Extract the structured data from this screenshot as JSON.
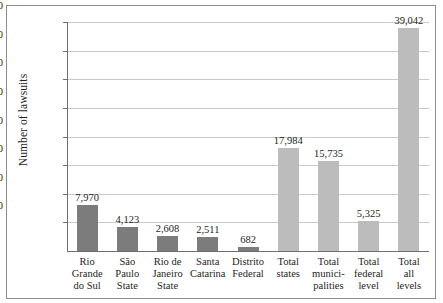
{
  "chart_data": {
    "type": "bar",
    "title": "",
    "xlabel": "",
    "ylabel": "Number of lawsuits",
    "ylim": [
      0,
      40000
    ],
    "ytick_step": 5000,
    "grid": true,
    "legend": "none",
    "categories": [
      "Rio Grande do Sul",
      "São Paulo State",
      "Rio de Janeiro State",
      "Santa Catarina",
      "Distrito Federal",
      "Total states",
      "Total municipalities",
      "Total federal level",
      "Total all levels"
    ],
    "category_label_lines": [
      [
        "Rio",
        "Grande",
        "do Sul"
      ],
      [
        "São",
        "Paulo",
        "State"
      ],
      [
        "Rio de",
        "Janeiro",
        "State"
      ],
      [
        "Santa",
        "Catarina"
      ],
      [
        "Distrito",
        "Federal"
      ],
      [
        "Total",
        "states"
      ],
      [
        "Total",
        "munici-",
        "palities"
      ],
      [
        "Total",
        "federal",
        "level"
      ],
      [
        "Total",
        "all",
        "levels"
      ]
    ],
    "values": [
      7970,
      4123,
      2608,
      2511,
      682,
      17984,
      15735,
      5325,
      39042
    ],
    "value_labels": [
      "7,970",
      "4,123",
      "2,608",
      "2,511",
      "682",
      "17,984",
      "15,735",
      "5,325",
      "39,042"
    ],
    "ytick_labels": [
      "40,000",
      "35,000",
      "30,000",
      "25,000",
      "20,000",
      "15,000",
      "10,000",
      "5,000"
    ],
    "yticks": [
      40000,
      35000,
      30000,
      25000,
      20000,
      15000,
      10000,
      5000
    ],
    "bar_styles": [
      "dark",
      "dark",
      "dark",
      "dark",
      "dark",
      "light",
      "light",
      "light",
      "light"
    ],
    "colors": {
      "bar_dark": "#7c7c7c",
      "bar_light": "#bcbcbc",
      "gridline": "#c9c9c9",
      "axis": "#6f6f6f",
      "frame": "#8d8d8d",
      "text": "#231f20",
      "background": "#ffffff"
    }
  }
}
